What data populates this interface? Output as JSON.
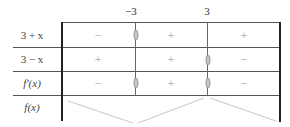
{
  "table": {
    "critical_points": [
      {
        "label": "−3",
        "x": 135
      },
      {
        "label": "3",
        "x": 207
      }
    ],
    "rows": [
      {
        "label": "3 + x",
        "signs": [
          "−",
          "+",
          "+"
        ],
        "zeros_at": [
          "−3"
        ]
      },
      {
        "label": "3 − x",
        "signs": [
          "+",
          "+",
          "−"
        ],
        "zeros_at": [
          "3"
        ]
      },
      {
        "label": "f′(x)",
        "signs": [
          "−",
          "+",
          "−"
        ],
        "zeros_at": [
          "−3",
          "3"
        ]
      },
      {
        "label": "f(x)",
        "variation": [
          "decreasing",
          "increasing",
          "decreasing"
        ]
      }
    ],
    "colors": {
      "border": "#222222",
      "grid": "#555555",
      "sign": "#b8b8b8",
      "zero_marker": "#c4c4c4",
      "variation_line": "#c8c8c8"
    }
  }
}
